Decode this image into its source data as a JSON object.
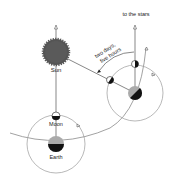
{
  "diagram": {
    "type": "astronomy-orbit",
    "labels": {
      "sun": "Sun",
      "moon": "Moon",
      "earth": "Earth",
      "stars": "to the stars",
      "interval_line1": "two days,",
      "interval_line2": "five hours"
    },
    "colors": {
      "line": "#555555",
      "orbit": "#8a8a8a",
      "sun": "#555555",
      "dark": "#111111",
      "light_gray": "#aaaaaa",
      "text": "#222222"
    }
  }
}
